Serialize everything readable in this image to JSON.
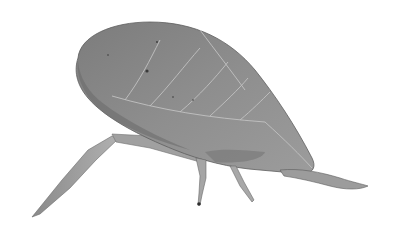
{
  "image": {
    "subject": "leaf-mimicking katydid (leaf insect)",
    "style": "grayscale photograph on white background",
    "colors": {
      "background": "#ffffff",
      "body_main": "#8a8a8a",
      "body_shadow": "#6f6f6f",
      "body_light": "#a8a8a8",
      "veins": "#c4c4c4",
      "legs": "#9a9a9a",
      "dark_spots": "#3a3a3a"
    }
  }
}
